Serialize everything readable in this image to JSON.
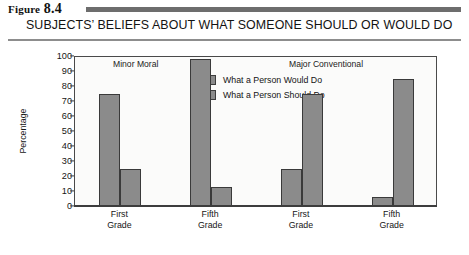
{
  "figure": {
    "number_word": "Figure",
    "number": "8.4",
    "caption": "SUBJECTS’ BELIEFS ABOUT WHAT SOMEONE SHOULD OR WOULD DO"
  },
  "chart_data": {
    "type": "bar",
    "title": "SUBJECTS’ BELIEFS ABOUT WHAT SOMEONE SHOULD OR WOULD DO",
    "xlabel": "",
    "ylabel": "Percentage",
    "ylim": [
      0,
      100
    ],
    "yticks": [
      0,
      10,
      20,
      30,
      40,
      50,
      60,
      70,
      80,
      90,
      100
    ],
    "grid": false,
    "legend_position": "top-center",
    "group_headings": [
      "Minor Moral",
      "Major Conventional"
    ],
    "categories": [
      "First Grade",
      "Fifth Grade",
      "First Grade",
      "Fifth Grade"
    ],
    "category_lines": [
      [
        "First",
        "Grade"
      ],
      [
        "Fifth",
        "Grade"
      ],
      [
        "First",
        "Grade"
      ],
      [
        "Fifth",
        "Grade"
      ]
    ],
    "series": [
      {
        "name": "What a Person Would Do",
        "color": "#8b8b8b",
        "values": [
          75,
          98,
          25,
          6
        ]
      },
      {
        "name": "What a Person Should Do",
        "color": "#8b8b8b",
        "values": [
          25,
          13,
          75,
          85
        ]
      }
    ]
  }
}
